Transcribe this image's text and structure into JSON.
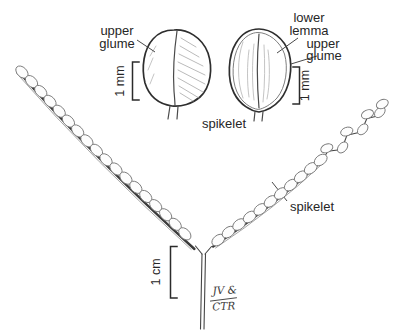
{
  "figure": {
    "background": "#ffffff",
    "ink_color": "#2e2e2e",
    "shading_color": "#a3a3a3",
    "labels": {
      "upper_glume_left": {
        "line1": "upper",
        "line2": "glume"
      },
      "lower_lemma": {
        "line1": "lower",
        "line2": "lemma"
      },
      "upper_glume_right": {
        "line1": "upper",
        "line2": "glume"
      },
      "spikelet_top": "spikelet",
      "spikelet_branch": "spikelet"
    },
    "scale_bars": {
      "left_mm": "1 mm",
      "right_mm": "1 mm",
      "bottom_cm": "1 cm"
    },
    "signature": {
      "line1": "JV &",
      "line2": "CTR"
    }
  }
}
